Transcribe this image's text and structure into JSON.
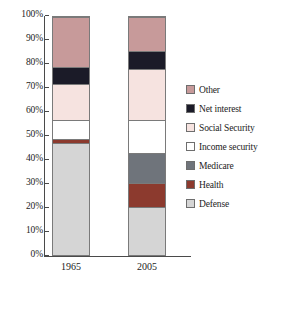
{
  "chart_data": {
    "type": "bar",
    "subtype": "stacked-percent",
    "title": "",
    "xlabel": "",
    "ylabel": "",
    "categories": [
      "1965",
      "2005"
    ],
    "ylim": [
      0,
      100
    ],
    "ytick_labels": [
      "100%",
      "90%",
      "80%",
      "70%",
      "60%",
      "50%",
      "40%",
      "30%",
      "20%",
      "10%",
      "0%"
    ],
    "ytick_values": [
      100,
      90,
      80,
      70,
      60,
      50,
      40,
      30,
      20,
      10,
      0
    ],
    "grid": false,
    "legend_position": "right",
    "stack_order_bottom_to_top": [
      "Defense",
      "Health",
      "Medicare",
      "Income security",
      "Social Security",
      "Net interest",
      "Other"
    ],
    "series": [
      {
        "name": "Other",
        "color": "#C79A9A",
        "values": [
          21.0,
          14.0
        ]
      },
      {
        "name": "Net interest",
        "color": "#1B1B28",
        "values": [
          7.0,
          7.5
        ]
      },
      {
        "name": "Social Security",
        "color": "#F6E3E0",
        "values": [
          15.0,
          21.5
        ]
      },
      {
        "name": "Income security",
        "color": "#FFFFFF",
        "values": [
          8.0,
          13.5
        ]
      },
      {
        "name": "Medicare",
        "color": "#6F747B",
        "values": [
          0.0,
          12.5
        ]
      },
      {
        "name": "Health",
        "color": "#8C3A2E",
        "values": [
          1.5,
          10.0
        ]
      },
      {
        "name": "Defense",
        "color": "#D5D5D5",
        "values": [
          47.5,
          21.0
        ]
      }
    ],
    "cumulative_boundaries": {
      "1965": {
        "Defense": [
          0,
          47.5
        ],
        "Health": [
          47.5,
          49.0
        ],
        "Medicare": [
          49.0,
          49.0
        ],
        "Income security": [
          49.0,
          57.0
        ],
        "Social Security": [
          57.0,
          72.0
        ],
        "Net interest": [
          72.0,
          79.0
        ],
        "Other": [
          79.0,
          100.0
        ]
      },
      "2005": {
        "Defense": [
          0,
          21.0
        ],
        "Health": [
          21.0,
          31.0
        ],
        "Medicare": [
          31.0,
          43.5
        ],
        "Income security": [
          43.5,
          57.0
        ],
        "Social Security": [
          57.0,
          78.5
        ],
        "Net interest": [
          78.5,
          86.0
        ],
        "Other": [
          86.0,
          100.0
        ]
      }
    }
  },
  "axis": {
    "ticks": [
      {
        "label": "100%",
        "value": 100
      },
      {
        "label": "90%",
        "value": 90
      },
      {
        "label": "80%",
        "value": 80
      },
      {
        "label": "70%",
        "value": 70
      },
      {
        "label": "60%",
        "value": 60
      },
      {
        "label": "50%",
        "value": 50
      },
      {
        "label": "40%",
        "value": 40
      },
      {
        "label": "30%",
        "value": 30
      },
      {
        "label": "20%",
        "value": 20
      },
      {
        "label": "10%",
        "value": 10
      },
      {
        "label": "0%",
        "value": 0
      }
    ],
    "category_labels": [
      "1965",
      "2005"
    ]
  },
  "legend": {
    "items": [
      {
        "label": "Other",
        "color": "#C79A9A"
      },
      {
        "label": "Net interest",
        "color": "#1B1B28"
      },
      {
        "label": "Social Security",
        "color": "#F6E3E0"
      },
      {
        "label": "Income security",
        "color": "#FFFFFF"
      },
      {
        "label": "Medicare",
        "color": "#6F747B"
      },
      {
        "label": "Health",
        "color": "#8C3A2E"
      },
      {
        "label": "Defense",
        "color": "#D5D5D5"
      }
    ]
  }
}
